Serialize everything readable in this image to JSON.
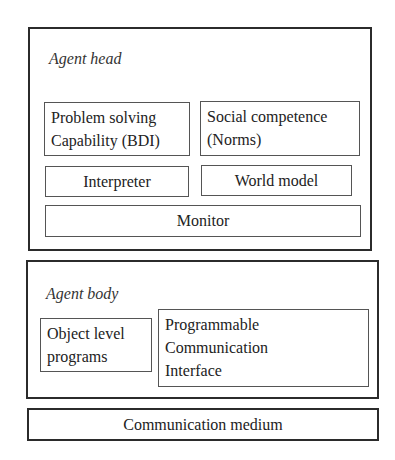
{
  "diagram": {
    "agent_head": {
      "title": "Agent head",
      "components": {
        "problem_solving": "Problem solving\nCapability (BDI)",
        "social_competence": "Social competence\n(Norms)",
        "interpreter": "Interpreter",
        "world_model": "World model",
        "monitor": "Monitor"
      }
    },
    "agent_body": {
      "title": "Agent body",
      "components": {
        "object_level_programs": "Object level\nprograms",
        "programmable_interface": "Programmable\nCommunication\nInterface"
      }
    },
    "communication_medium": "Communication medium"
  }
}
